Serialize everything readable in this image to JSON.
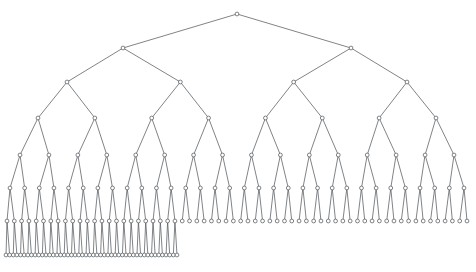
{
  "figure": {
    "kind": "node-link-tree",
    "background_color": "#ffffff",
    "width": 476,
    "height": 272
  },
  "style": {
    "edge_color": "#555b60",
    "edge_width": 0.75,
    "node_stroke_color": "#4a5055",
    "node_fill_color": "#ffffff",
    "node_stroke_width": 0.7,
    "node_radius": 1.9
  },
  "tree": {
    "type": "binary-tree",
    "branching_factor": 2,
    "depth": 7,
    "root": {
      "x": 237,
      "y": 14
    },
    "levels": [
      {
        "index": 0,
        "y": 14,
        "node_count": 1,
        "half_span": 0,
        "complete": true
      },
      {
        "index": 1,
        "y": 48,
        "node_count": 2,
        "half_span": 114,
        "complete": true
      },
      {
        "index": 2,
        "y": 82,
        "node_count": 4,
        "half_span": 170,
        "complete": true
      },
      {
        "index": 3,
        "y": 118,
        "node_count": 8,
        "half_span": 199,
        "complete": true
      },
      {
        "index": 4,
        "y": 155,
        "node_count": 16,
        "half_span": 217,
        "complete": true
      },
      {
        "index": 5,
        "y": 188,
        "node_count": 32,
        "half_span": 227,
        "complete": true
      },
      {
        "index": 6,
        "y": 221,
        "node_count": 64,
        "half_span": 230,
        "complete": true
      },
      {
        "index": 7,
        "y": 255,
        "node_count": 48,
        "half_span": 231,
        "complete": false
      }
    ],
    "truncation": {
      "deepest_level": 7,
      "rendered_node_count": 48,
      "full_node_count": 128,
      "note": "Deepest level drawn only for the left portion; it ends near x=360."
    },
    "extent": {
      "leftmost_x": 6,
      "rightmost_x": 466,
      "top_y": 14,
      "bottom_y": 255
    },
    "totals": {
      "drawn_nodes": 175,
      "drawn_edges": 174
    }
  }
}
